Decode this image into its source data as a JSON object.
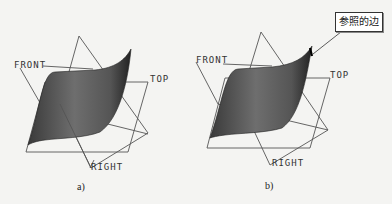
{
  "figures": [
    {
      "id": "a",
      "caption": "a)",
      "labels": {
        "front": "FRONT",
        "top": "TOP",
        "right": "RIGHT"
      }
    },
    {
      "id": "b",
      "caption": "b)",
      "labels": {
        "front": "FRONT",
        "top": "TOP",
        "right": "RIGHT"
      },
      "callout": "参照的边"
    }
  ],
  "colors": {
    "surface_dark": "#2e2e2e",
    "surface_light": "#8a8a8a",
    "plane_line": "#555555",
    "background": "#f4f4f2"
  }
}
